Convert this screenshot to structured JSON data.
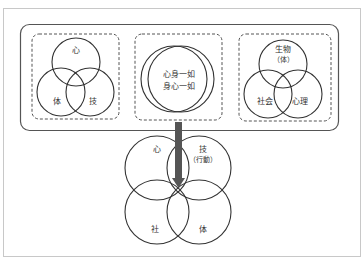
{
  "diagram": {
    "colors": {
      "frame": "#c8c8c8",
      "line": "#333333",
      "arrow": "#555555",
      "dashed": "#555555"
    },
    "top_group": {
      "panel_left": {
        "labels": {
          "top": "心",
          "bottom_left": "体",
          "bottom_right": "技"
        }
      },
      "panel_center": {
        "labels": {
          "line1": "心身一如",
          "line2": "身心一如"
        }
      },
      "panel_right": {
        "labels": {
          "top_line1": "生物",
          "top_line2": "（体）",
          "bottom_left": "社会",
          "bottom_right": "心理"
        }
      }
    },
    "bottom_venn": {
      "labels": {
        "top_left": "心",
        "top_right_line1": "技",
        "top_right_line2": "（行動）",
        "bottom_left": "社",
        "bottom_right": "体"
      }
    }
  }
}
